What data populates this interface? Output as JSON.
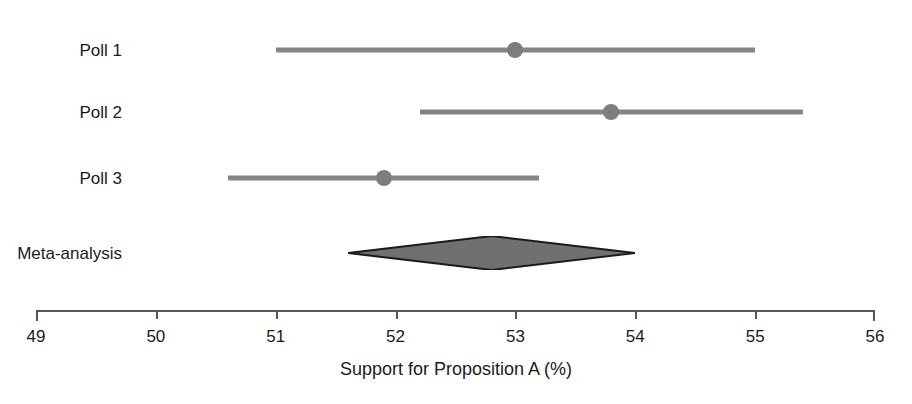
{
  "chart_data": {
    "type": "forest",
    "title": "",
    "xlabel": "Support for Proposition A (%)",
    "ylabel": "",
    "xlim": [
      49,
      56
    ],
    "xticks": [
      49,
      50,
      51,
      52,
      53,
      54,
      55,
      56
    ],
    "xtick_labels": [
      "49",
      "50",
      "51",
      "52",
      "53",
      "54",
      "55",
      "56"
    ],
    "grid": false,
    "legend": false,
    "studies": [
      {
        "label": "Poll 1",
        "estimate": 53.0,
        "ci_low": 51.0,
        "ci_high": 55.0,
        "marker": "circle"
      },
      {
        "label": "Poll 2",
        "estimate": 53.8,
        "ci_low": 52.2,
        "ci_high": 55.4,
        "marker": "circle"
      },
      {
        "label": "Poll 3",
        "estimate": 51.9,
        "ci_low": 50.6,
        "ci_high": 53.2,
        "marker": "circle"
      }
    ],
    "summary": {
      "label": "Meta-analysis",
      "estimate": 52.8,
      "ci_low": 51.6,
      "ci_high": 54.0,
      "marker": "diamond"
    },
    "colors": {
      "ci_line": "#858585",
      "point": "#7d7d7d",
      "diamond_fill": "#707070",
      "diamond_stroke": "#1a1a1a",
      "axis": "#555555",
      "text": "#1a1a1a",
      "background": "#ffffff"
    }
  }
}
